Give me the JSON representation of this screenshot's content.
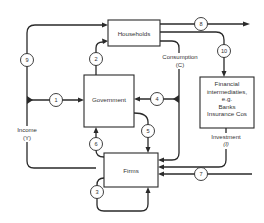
{
  "diagram": {
    "type": "circular-flow-of-income",
    "nodes": {
      "households": {
        "label": "Households"
      },
      "government": {
        "label": "Government"
      },
      "firms": {
        "label": "Firms"
      },
      "financial": {
        "lines": [
          "Financial",
          "intermediaties,",
          "e.g.",
          "Banks",
          "Insurance Cos"
        ]
      }
    },
    "flow_labels": {
      "income": {
        "line1": "Income",
        "line2": "(Y)"
      },
      "consumption": {
        "line1": "Consumption",
        "line2": "(C)"
      },
      "investment": {
        "line1": "Investment",
        "line2": "(I)"
      }
    },
    "flows": [
      {
        "id": "1",
        "from": "Income (Y)",
        "to": "Government"
      },
      {
        "id": "2",
        "from": "Government",
        "to": "Households"
      },
      {
        "id": "3",
        "from": "Firms",
        "to": "Firms"
      },
      {
        "id": "4",
        "from": "Consumption (C)",
        "to": "Government"
      },
      {
        "id": "5",
        "from": "Government",
        "to": "Firms"
      },
      {
        "id": "6",
        "from": "Firms",
        "to": "Government"
      },
      {
        "id": "7",
        "from": "External",
        "to": "Firms"
      },
      {
        "id": "8",
        "from": "Households",
        "to": "External"
      },
      {
        "id": "9",
        "from": "Income (Y)",
        "to": "Households"
      },
      {
        "id": "10",
        "from": "Households",
        "to": "Financial intermediaries"
      }
    ],
    "colors": {
      "line": "#2a2a2a",
      "text": "#333333",
      "background": "#ffffff"
    }
  }
}
